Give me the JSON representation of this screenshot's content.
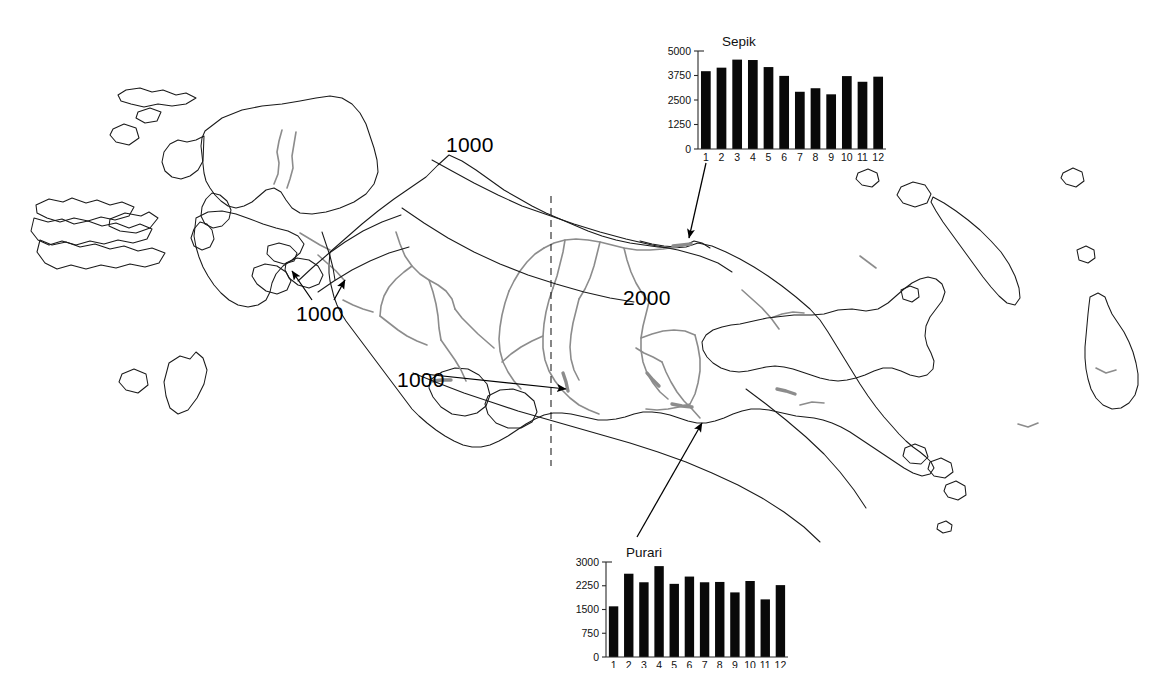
{
  "figure": {
    "region_name": "New Guinea",
    "background_color": "#ffffff",
    "coast_color": "#1a1a1a",
    "river_color": "#8c8c8c"
  },
  "map": {
    "contour_labels": [
      {
        "id": "north-1000",
        "text": "1000",
        "x": 446,
        "y": 133
      },
      {
        "id": "west-1000",
        "text": "1000",
        "x": 296,
        "y": 302
      },
      {
        "id": "central-2000",
        "text": "2000",
        "x": 623,
        "y": 286
      },
      {
        "id": "south-1000",
        "text": "1000",
        "x": 397,
        "y": 368
      }
    ],
    "border_line": "dashed-international-border",
    "arrows": [
      {
        "id": "sepik-leader",
        "from_chart": "Sepik",
        "to_x": 688,
        "to_y": 243
      },
      {
        "id": "purari-leader",
        "from_chart": "Purari",
        "to_x": 700,
        "to_y": 418
      }
    ]
  },
  "chart_data": [
    {
      "id": "sepik",
      "type": "bar",
      "title": "Sepik",
      "categories": [
        "1",
        "2",
        "3",
        "4",
        "5",
        "6",
        "7",
        "8",
        "9",
        "10",
        "11",
        "12"
      ],
      "values": [
        3970,
        4150,
        4560,
        4540,
        4180,
        3730,
        2920,
        3100,
        2790,
        3720,
        3430,
        3690
      ],
      "ylabel": "",
      "xlabel": "",
      "yticks": [
        0,
        1250,
        2500,
        3750,
        5000
      ],
      "ylim": [
        0,
        5000
      ],
      "grid": false,
      "legend": "none"
    },
    {
      "id": "purari",
      "type": "bar",
      "title": "Purari",
      "categories": [
        "1",
        "2",
        "3",
        "4",
        "5",
        "6",
        "7",
        "8",
        "9",
        "10",
        "11",
        "12"
      ],
      "values": [
        1600,
        2630,
        2360,
        2870,
        2310,
        2540,
        2360,
        2370,
        2040,
        2400,
        1820,
        2270
      ],
      "ylabel": "",
      "xlabel": "",
      "yticks": [
        0,
        750,
        1500,
        2250,
        3000
      ],
      "ylim": [
        0,
        3000
      ],
      "grid": false,
      "legend": "none"
    }
  ]
}
